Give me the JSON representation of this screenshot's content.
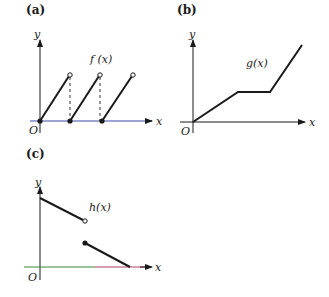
{
  "panels": [
    {
      "id": "a",
      "label": "(a)",
      "function_label": "f (x)",
      "axis_x": "x",
      "axis_y": "y",
      "origin": "O",
      "axis_color": "#3b4aa8"
    },
    {
      "id": "b",
      "label": "(b)",
      "function_label": "g(x)",
      "axis_x": "x",
      "axis_y": "y",
      "origin": "O",
      "axis_color": "#1a1a1a"
    },
    {
      "id": "c",
      "label": "(c)",
      "function_label": "h(x)",
      "axis_x": "x",
      "axis_y": "y",
      "origin": "O",
      "axis_color_left": "#3a8a3a",
      "axis_color_right": "#b04060"
    }
  ]
}
